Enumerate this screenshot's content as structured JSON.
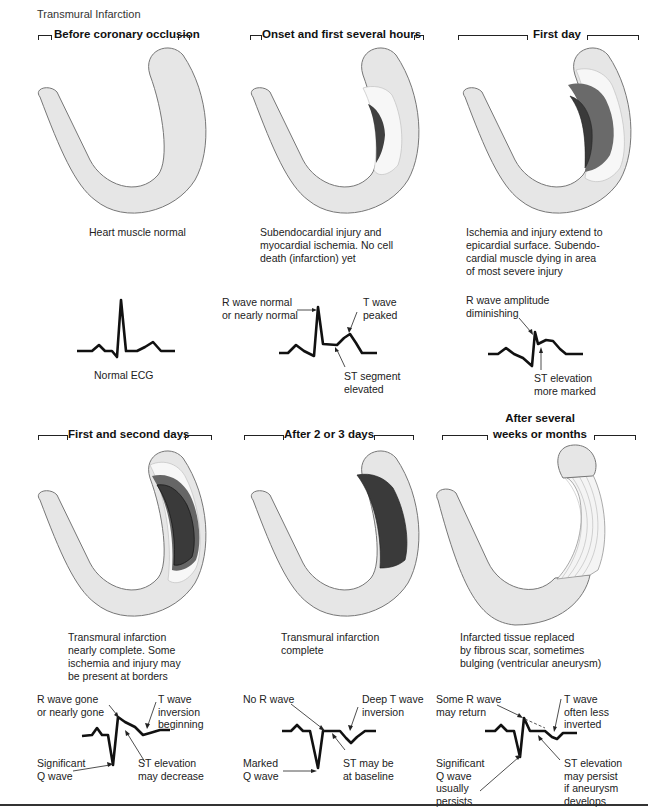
{
  "figure": {
    "title": "Transmural Infarction",
    "colors": {
      "muscle": "#e6e6e6",
      "ischemia": "#f7f7f7",
      "injury": "#6a6a6a",
      "infarction": "#3e3e3e",
      "outline": "#777777",
      "ecg": "#111111"
    }
  },
  "stages": [
    {
      "title": "Before coronary occlusion",
      "caption": "Heart muscle normal",
      "ecg": {
        "caption": "Normal ECG",
        "labels": []
      }
    },
    {
      "title": "Onset and first several hours",
      "caption": "Subendocardial injury and myocardial ischemia.  No cell death (infarction) yet",
      "caption_lines": [
        "Subendocardial injury and",
        "myocardial ischemia.  No cell",
        "death (infarction) yet"
      ],
      "ecg": {
        "labels": [
          {
            "lines": [
              "R wave normal",
              "or nearly normal"
            ]
          },
          {
            "lines": [
              "T wave",
              "peaked"
            ]
          },
          {
            "lines": [
              "ST segment",
              "elevated"
            ]
          }
        ]
      }
    },
    {
      "title": "First day",
      "caption_lines": [
        "Ischemia and injury extend to",
        "epicardial surface.  Subendo-",
        "cardial muscle dying in area",
        "of most severe injury"
      ],
      "ecg": {
        "labels": [
          {
            "lines": [
              "R wave amplitude",
              "diminishing"
            ]
          },
          {
            "lines": [
              "ST elevation",
              "more marked"
            ]
          }
        ]
      }
    },
    {
      "title": "First and second days",
      "caption_lines": [
        "Transmural infarction",
        "nearly complete. Some",
        "ischemia and injury may",
        "be present at borders"
      ],
      "ecg": {
        "labels": [
          {
            "lines": [
              "R wave gone",
              "or nearly gone"
            ]
          },
          {
            "lines": [
              "T wave",
              "inversion",
              "beginning"
            ]
          },
          {
            "lines": [
              "Significant",
              "Q wave"
            ]
          },
          {
            "lines": [
              "ST elevation",
              "may decrease"
            ]
          }
        ]
      }
    },
    {
      "title": "After 2 or 3 days",
      "caption_lines": [
        "Transmural infarction",
        "complete"
      ],
      "ecg": {
        "labels": [
          {
            "lines": [
              "No R wave"
            ]
          },
          {
            "lines": [
              "Deep T wave",
              "inversion"
            ]
          },
          {
            "lines": [
              "Marked",
              "Q wave"
            ]
          },
          {
            "lines": [
              "ST may be",
              "at baseline"
            ]
          }
        ]
      }
    },
    {
      "title_lines": [
        "After several",
        "weeks or months"
      ],
      "caption_lines": [
        "Infarcted tissue replaced",
        "by fibrous scar, sometimes",
        "bulging (ventricular aneurysm)"
      ],
      "ecg": {
        "labels": [
          {
            "lines": [
              "Some R wave",
              "may return"
            ]
          },
          {
            "lines": [
              "T wave",
              "often less",
              "inverted"
            ]
          },
          {
            "lines": [
              "Significant",
              "Q wave",
              "usually",
              "persists"
            ]
          },
          {
            "lines": [
              "ST elevation",
              "may persist",
              "if aneurysm",
              "develops"
            ]
          }
        ]
      }
    }
  ]
}
